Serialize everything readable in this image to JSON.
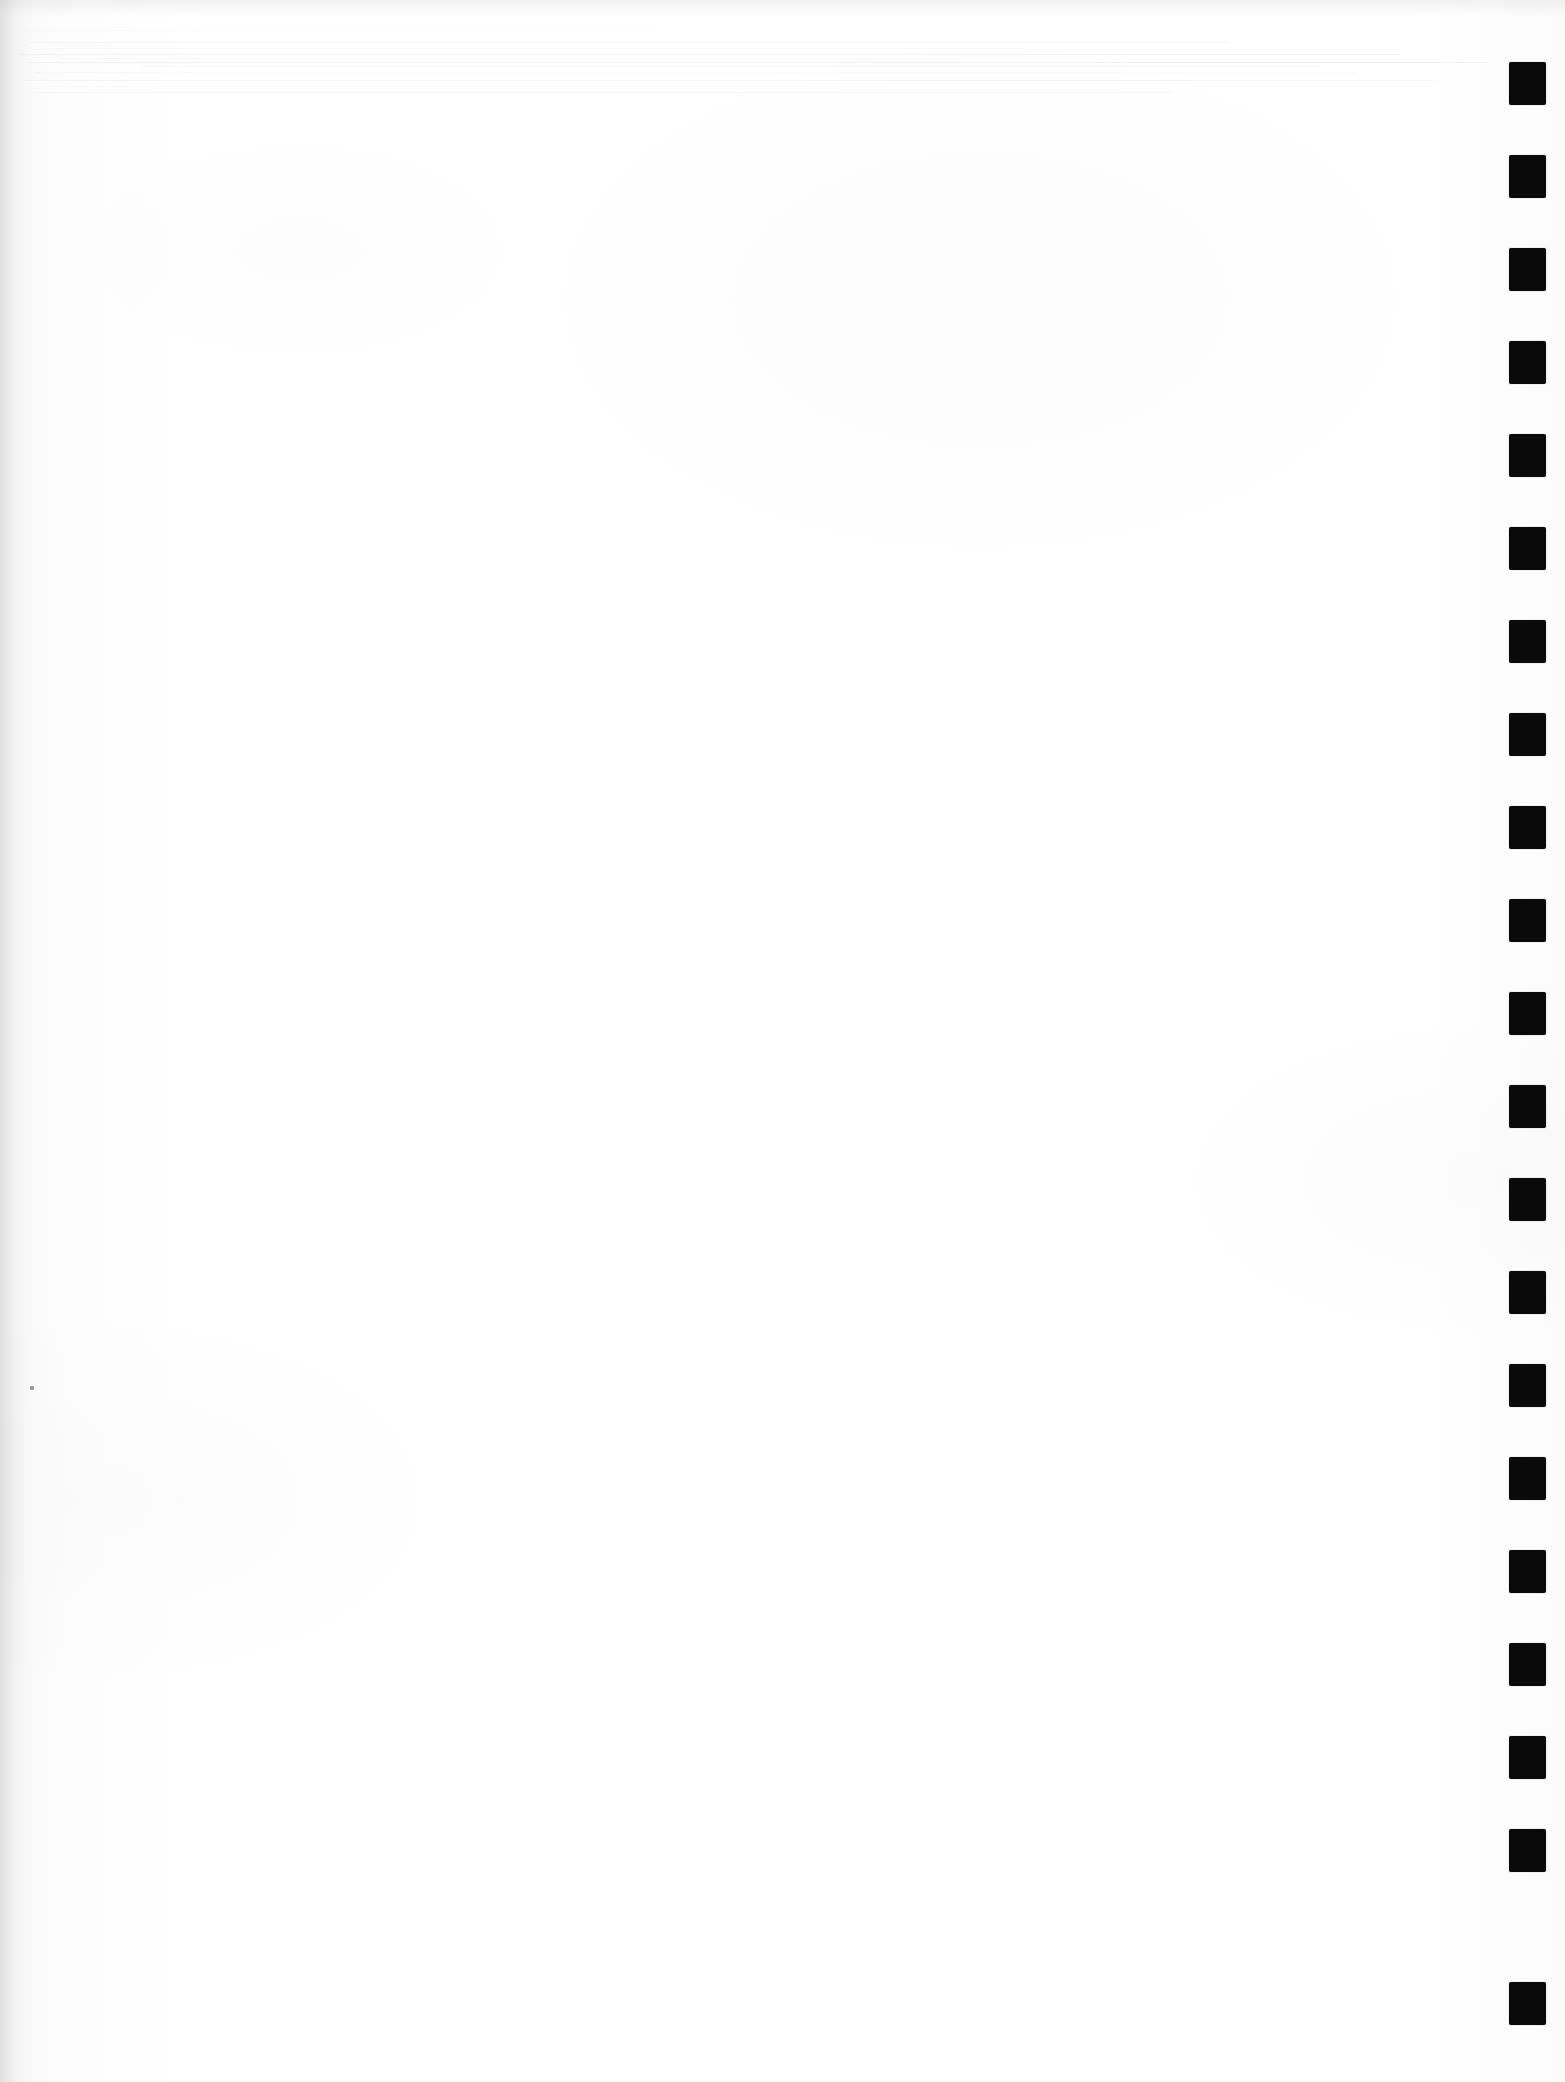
{
  "document": {
    "title": "Scanned Blank Page",
    "page_width": 1565,
    "page_height": 2082,
    "background_color": "#fefefe",
    "body_text": "",
    "body_note": "blank page — no printed text or figures"
  },
  "artifacts": {
    "scan_streaks": {
      "name": "horizontal-scan-streaks",
      "color": "#e2e2e6",
      "region_top": 0,
      "region_height": 120,
      "lines": [
        {
          "x": 30,
          "y": 42,
          "width": 1200,
          "opacity": 0.3
        },
        {
          "x": 46,
          "y": 48,
          "width": 980,
          "opacity": 0.22
        },
        {
          "x": 20,
          "y": 54,
          "width": 1380,
          "opacity": 0.38
        },
        {
          "x": 60,
          "y": 58,
          "width": 900,
          "opacity": 0.2
        },
        {
          "x": 28,
          "y": 62,
          "width": 1460,
          "opacity": 0.45
        },
        {
          "x": 140,
          "y": 66,
          "width": 1180,
          "opacity": 0.26
        },
        {
          "x": 36,
          "y": 72,
          "width": 1320,
          "opacity": 0.24
        },
        {
          "x": 24,
          "y": 80,
          "width": 1410,
          "opacity": 0.34
        },
        {
          "x": 70,
          "y": 86,
          "width": 820,
          "opacity": 0.18
        },
        {
          "x": 32,
          "y": 92,
          "width": 1140,
          "opacity": 0.22
        },
        {
          "x": 18,
          "y": 30,
          "width": 640,
          "opacity": 0.14
        },
        {
          "x": 660,
          "y": 36,
          "width": 720,
          "opacity": 0.12
        }
      ]
    },
    "register_marks": {
      "name": "right-edge-register-marks",
      "color": "#0a0a0a",
      "count": 21,
      "x": 1509,
      "width": 37,
      "height": 43,
      "first_y": 62,
      "pitch": 93,
      "marks": [
        {
          "index": 1,
          "y": 62
        },
        {
          "index": 2,
          "y": 155
        },
        {
          "index": 3,
          "y": 248
        },
        {
          "index": 4,
          "y": 341
        },
        {
          "index": 5,
          "y": 434
        },
        {
          "index": 6,
          "y": 527
        },
        {
          "index": 7,
          "y": 620
        },
        {
          "index": 8,
          "y": 713
        },
        {
          "index": 9,
          "y": 806
        },
        {
          "index": 10,
          "y": 899
        },
        {
          "index": 11,
          "y": 992
        },
        {
          "index": 12,
          "y": 1085
        },
        {
          "index": 13,
          "y": 1178
        },
        {
          "index": 14,
          "y": 1271
        },
        {
          "index": 15,
          "y": 1364
        },
        {
          "index": 16,
          "y": 1457
        },
        {
          "index": 17,
          "y": 1550
        },
        {
          "index": 18,
          "y": 1643
        },
        {
          "index": 19,
          "y": 1736
        },
        {
          "index": 20,
          "y": 1829
        },
        {
          "index": 21,
          "y": 1982
        }
      ]
    },
    "specks": [
      {
        "name": "left-margin-speck",
        "x": 30,
        "y": 1386,
        "width": 4,
        "height": 4
      }
    ]
  }
}
